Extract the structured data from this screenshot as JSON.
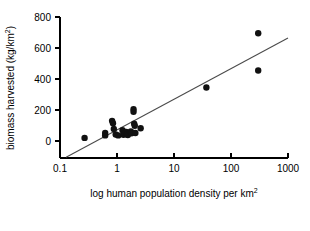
{
  "chart_data": {
    "type": "scatter",
    "title": "",
    "subtitle": "",
    "xlabel": "log human population density per km2",
    "xlabel_base": "log human population density per km",
    "xlabel_sup": "2",
    "ylabel": "biomass harvested (kg/km2)",
    "ylabel_base": "biomass harvested (kg/km",
    "ylabel_sup": "2",
    "ylabel_tail": ")",
    "xscale": "log",
    "yscale": "linear",
    "xlim": [
      0.1,
      1000
    ],
    "ylim": [
      -110,
      800
    ],
    "grid": false,
    "legend": false,
    "legend_position": "none",
    "xticks": [
      0.1,
      1,
      10,
      100,
      1000
    ],
    "xtick_labels": [
      "0.1",
      "1",
      "10",
      "100",
      "1000"
    ],
    "yticks": [
      0,
      200,
      400,
      600,
      800
    ],
    "ytick_labels": [
      "0",
      "200",
      "400",
      "600",
      "800"
    ],
    "marker": "filled-circle",
    "marker_color": "#111111",
    "marker_size_px": 4.2,
    "series": [
      {
        "name": "biomass harvested vs human population density",
        "points": [
          {
            "x": 0.27,
            "y": 20
          },
          {
            "x": 0.62,
            "y": 52
          },
          {
            "x": 0.62,
            "y": 36
          },
          {
            "x": 0.82,
            "y": 130
          },
          {
            "x": 0.85,
            "y": 115
          },
          {
            "x": 0.88,
            "y": 78
          },
          {
            "x": 0.95,
            "y": 42
          },
          {
            "x": 1.05,
            "y": 36
          },
          {
            "x": 1.25,
            "y": 70
          },
          {
            "x": 1.3,
            "y": 40
          },
          {
            "x": 1.45,
            "y": 58
          },
          {
            "x": 1.5,
            "y": 44
          },
          {
            "x": 1.55,
            "y": 38
          },
          {
            "x": 1.75,
            "y": 62
          },
          {
            "x": 1.8,
            "y": 50
          },
          {
            "x": 1.95,
            "y": 205
          },
          {
            "x": 1.95,
            "y": 188
          },
          {
            "x": 2.0,
            "y": 112
          },
          {
            "x": 2.05,
            "y": 98
          },
          {
            "x": 2.1,
            "y": 52
          },
          {
            "x": 2.6,
            "y": 82
          },
          {
            "x": 37,
            "y": 345
          },
          {
            "x": 300,
            "y": 695
          },
          {
            "x": 300,
            "y": 455
          }
        ]
      }
    ],
    "fit_line": {
      "type": "linear-on-log-x",
      "label": "",
      "color": "#4a4a4a",
      "endpoints": [
        {
          "x": 0.128,
          "y": -105
        },
        {
          "x": 1000,
          "y": 665
        }
      ]
    }
  }
}
